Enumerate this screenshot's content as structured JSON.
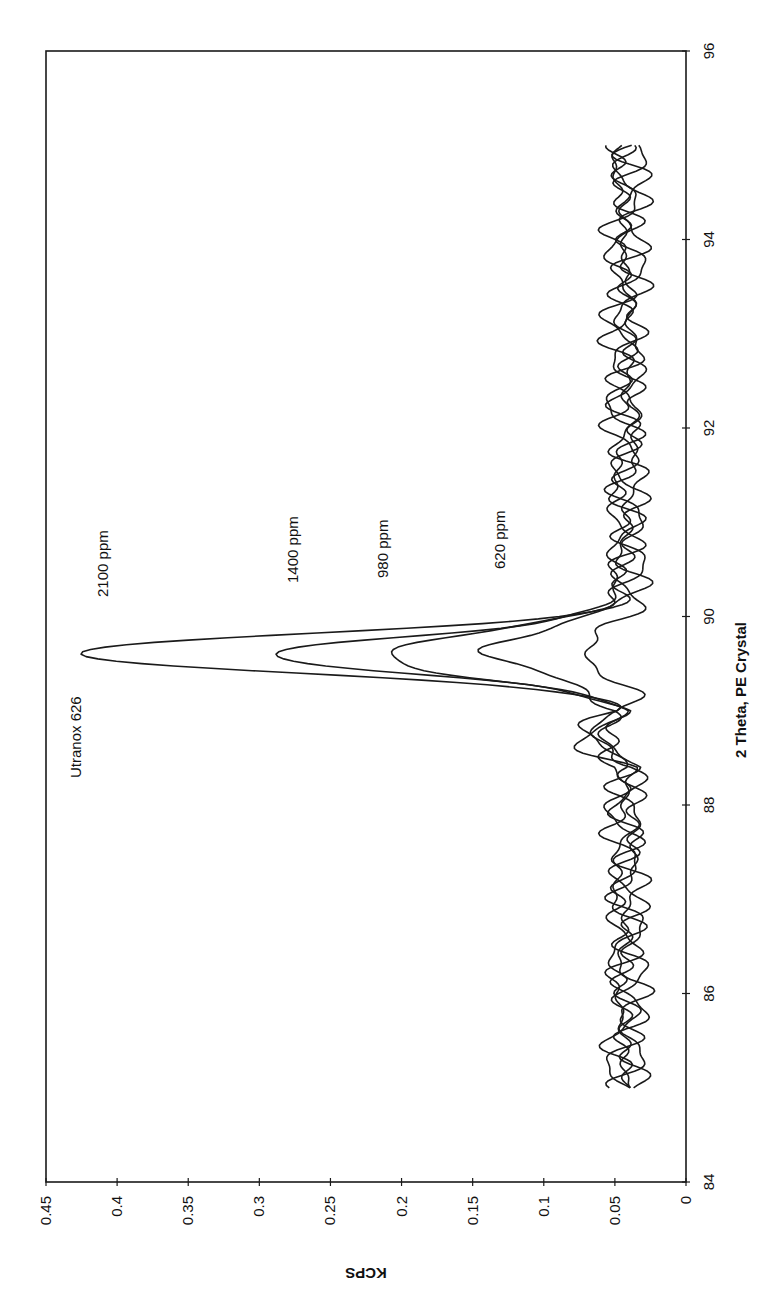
{
  "chart_data": {
    "type": "line",
    "orientation_note": "figure is rotated 90 degrees clockwise on the page",
    "title": "",
    "xlabel": "2 Theta, PE Crystal",
    "ylabel": "KCPS",
    "xlim": [
      84,
      96
    ],
    "ylim": [
      0,
      0.45
    ],
    "x_ticks": [
      "84",
      "86",
      "88",
      "90",
      "92",
      "94",
      "96"
    ],
    "y_ticks": [
      "0",
      "0.05",
      "0.1",
      "0.15",
      "0.2",
      "0.25",
      "0.3",
      "0.35",
      "0.4",
      "0.45"
    ],
    "grid": false,
    "legend": "none (inline annotations)",
    "annotations": [
      {
        "text": "Utranox 626",
        "x": 88.7,
        "y": 0.42
      },
      {
        "text": "2100 ppm",
        "x": 90.0,
        "y": 0.405
      },
      {
        "text": "1400 ppm",
        "x": 90.6,
        "y": 0.27
      },
      {
        "text": "980 ppm",
        "x": 90.5,
        "y": 0.21
      },
      {
        "text": "620 ppm",
        "x": 90.4,
        "y": 0.135
      }
    ],
    "x_range_of_data": [
      85,
      95
    ],
    "peak_position_2theta": 89.6,
    "series": [
      {
        "name": "2100 ppm",
        "peak_kcps": 0.43,
        "baseline_kcps": 0.045
      },
      {
        "name": "1400 ppm",
        "peak_kcps": 0.28,
        "baseline_kcps": 0.045
      },
      {
        "name": "980 ppm",
        "peak_kcps": 0.22,
        "baseline_kcps": 0.04
      },
      {
        "name": "620 ppm",
        "peak_kcps": 0.14,
        "baseline_kcps": 0.04
      },
      {
        "name": "blank",
        "peak_kcps": 0.065,
        "baseline_kcps": 0.04
      }
    ]
  },
  "labels": {
    "xlabel": "2 Theta, PE Crystal",
    "ylabel": "KCPS",
    "annot_utranox": "Utranox 626",
    "annot_2100": "2100 ppm",
    "annot_1400": "1400 ppm",
    "annot_980": "980 ppm",
    "annot_620": "620 ppm"
  }
}
